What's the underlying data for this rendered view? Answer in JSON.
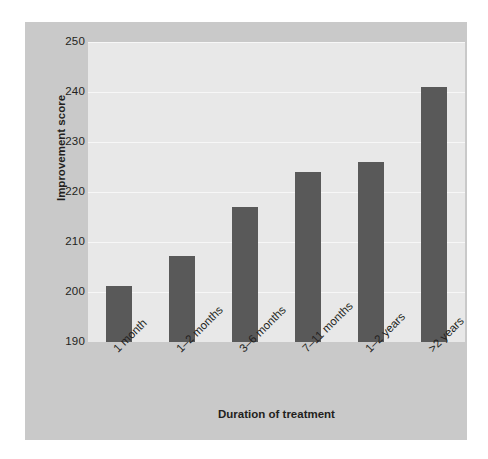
{
  "chart_data": {
    "type": "bar",
    "title": "",
    "subtitle": "",
    "xlabel": "Duration of treatment",
    "ylabel": "Improvement score",
    "categories": [
      "1 month",
      "1–2 months",
      "3–6 months",
      "7–11 months",
      "1–2 years",
      ">2 years"
    ],
    "values": [
      201.3,
      207.3,
      217.0,
      224.0,
      226.0,
      241.0
    ],
    "ylim": [
      190,
      250
    ],
    "yticks": [
      190,
      200,
      210,
      220,
      230,
      240,
      250
    ],
    "grid": true,
    "legend": "none",
    "series": [
      {
        "name": "Improvement score",
        "values": [
          201.3,
          207.3,
          217.0,
          224.0,
          226.0,
          241.0
        ]
      }
    ],
    "colors": {
      "bar": "#595959",
      "plot_background": "#e8e8e8",
      "panel_background": "#c9c9c9",
      "gridline": "#f7f7f7",
      "text": "#231f20",
      "figure_background": "#ffffff"
    }
  }
}
